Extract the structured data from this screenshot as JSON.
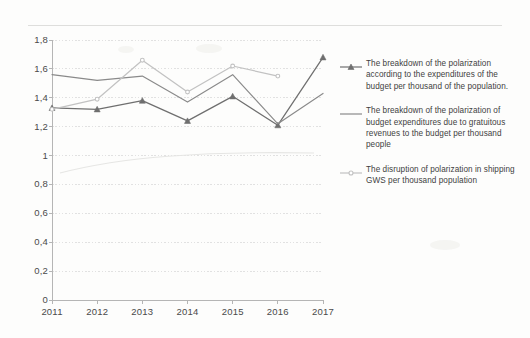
{
  "chart_data": {
    "type": "line",
    "title": "",
    "xlabel": "",
    "ylabel": "",
    "x": [
      "2011",
      "2012",
      "2013",
      "2014",
      "2015",
      "2016",
      "2017"
    ],
    "categories": [
      "2011",
      "2012",
      "2013",
      "2014",
      "2015",
      "2016",
      "2017"
    ],
    "ylim": [
      0,
      1.8
    ],
    "ytick_labels": [
      "1,8",
      "1,6",
      "1,4",
      "1,2",
      "1",
      "0,8",
      "0,6",
      "0,4",
      "0,2",
      "0"
    ],
    "ytick_values": [
      1.8,
      1.6,
      1.4,
      1.2,
      1.0,
      0.8,
      0.6,
      0.4,
      0.2,
      0
    ],
    "grid": true,
    "legend_position": "right",
    "decimal_separator": ",",
    "series": [
      {
        "name": "The breakdown of the polarization according to the expenditures of the budget per thousand of the population.",
        "color": "#6f6f6f",
        "marker": "triangle",
        "values": [
          1.33,
          1.32,
          1.38,
          1.24,
          1.41,
          1.21,
          1.68
        ]
      },
      {
        "name": "The breakdown of the polarization of budget expenditures due to gratuitous revenues to the budget per thousand people",
        "color": "#8a8a8a",
        "marker": "none",
        "values": [
          1.56,
          1.52,
          1.55,
          1.37,
          1.56,
          1.22,
          1.43
        ]
      },
      {
        "name": "The disruption of polarization in shipping GWS per thousand population",
        "color": "#c2c2c2",
        "marker": "dot",
        "values": [
          1.32,
          1.39,
          1.66,
          1.44,
          1.62,
          1.55,
          null
        ]
      }
    ]
  },
  "axes": {
    "y_ticks": [
      "1,8",
      "1,6",
      "1,4",
      "1,2",
      "1",
      "0,8",
      "0,6",
      "0,4",
      "0,2",
      "0"
    ],
    "x_ticks": [
      "2011",
      "2012",
      "2013",
      "2014",
      "2015",
      "2016",
      "2017"
    ]
  },
  "legend": {
    "items": [
      {
        "label": "The breakdown of the polarization according to the expenditures of the budget per thousand of the population.",
        "color": "#6f6f6f",
        "marker": "triangle"
      },
      {
        "label": "The breakdown of the polarization of budget expenditures due to gratuitous revenues to the budget per thousand people",
        "color": "#8a8a8a",
        "marker": "line"
      },
      {
        "label": "The disruption of polarization in shipping GWS per thousand population",
        "color": "#c2c2c2",
        "marker": "dot"
      }
    ]
  },
  "colors": {
    "background": "#fdfdfc",
    "grid": "#d9d9d9",
    "axis": "#b5b5b5",
    "text": "#404040"
  }
}
